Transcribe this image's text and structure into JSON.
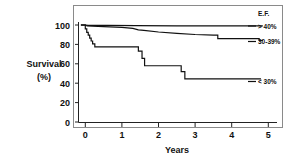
{
  "chart_data": {
    "type": "line",
    "title": "",
    "xlabel": "Years",
    "ylabel": "Survival (%)",
    "ylabel_line1": "Survival",
    "ylabel_line2": "(%)",
    "xlim": [
      -0.35,
      5.6
    ],
    "ylim": [
      0,
      108
    ],
    "grid": false,
    "legend_position": "right-inside",
    "legend_title": "E.F.",
    "x_ticks": [
      "0",
      "1",
      "2",
      "3",
      "4",
      "5"
    ],
    "x_tick_values": [
      0,
      1,
      2,
      3,
      4,
      5
    ],
    "y_ticks": [
      "0",
      "20",
      "40",
      "60",
      "80",
      "100"
    ],
    "y_tick_values": [
      0,
      20,
      40,
      60,
      80,
      100
    ],
    "curve_style": "step",
    "series": [
      {
        "name": "> 40%",
        "label": "> 40%",
        "color": "#111111",
        "points": [
          [
            -0.12,
            100.0
          ],
          [
            0.0,
            100.0
          ],
          [
            0.08,
            99.6
          ],
          [
            0.6,
            99.6
          ],
          [
            1.4,
            99.4
          ],
          [
            2.5,
            99.2
          ],
          [
            3.4,
            99.0
          ],
          [
            4.3,
            99.0
          ],
          [
            4.85,
            99.0
          ]
        ]
      },
      {
        "name": "30-39%",
        "label": "30-39%",
        "color": "#111111",
        "points": [
          [
            -0.12,
            100.0
          ],
          [
            0.0,
            100.0
          ],
          [
            0.05,
            99.0
          ],
          [
            0.5,
            98.4
          ],
          [
            1.0,
            97.6
          ],
          [
            1.3,
            96.6
          ],
          [
            1.45,
            95.0
          ],
          [
            1.6,
            94.4
          ],
          [
            2.0,
            92.8
          ],
          [
            2.5,
            91.4
          ],
          [
            3.0,
            90.2
          ],
          [
            3.5,
            89.6
          ],
          [
            3.62,
            89.6
          ],
          [
            3.62,
            86.0
          ],
          [
            4.3,
            86.0
          ],
          [
            4.75,
            86.0
          ],
          [
            4.75,
            84.0
          ],
          [
            4.85,
            84.0
          ]
        ]
      },
      {
        "name": "< 30%",
        "label": "< 30%",
        "color": "#111111",
        "points": [
          [
            -0.12,
            100.0
          ],
          [
            0.0,
            100.0
          ],
          [
            0.0,
            96.0
          ],
          [
            0.04,
            96.0
          ],
          [
            0.04,
            92.5
          ],
          [
            0.08,
            92.5
          ],
          [
            0.08,
            89.5
          ],
          [
            0.12,
            89.5
          ],
          [
            0.12,
            86.5
          ],
          [
            0.16,
            86.5
          ],
          [
            0.16,
            83.5
          ],
          [
            0.2,
            83.5
          ],
          [
            0.2,
            80.5
          ],
          [
            0.26,
            80.5
          ],
          [
            0.26,
            77.5
          ],
          [
            1.45,
            77.5
          ],
          [
            1.45,
            73.0
          ],
          [
            1.55,
            73.0
          ],
          [
            1.55,
            65.5
          ],
          [
            1.62,
            65.5
          ],
          [
            1.62,
            58.0
          ],
          [
            2.62,
            58.0
          ],
          [
            2.62,
            52.0
          ],
          [
            2.72,
            52.0
          ],
          [
            2.72,
            44.5
          ],
          [
            3.5,
            44.5
          ],
          [
            4.2,
            44.5
          ],
          [
            4.8,
            44.5
          ]
        ]
      }
    ],
    "annotations": []
  },
  "legend": {
    "title": "E.F.",
    "entries": [
      {
        "label": "> 40%"
      },
      {
        "label": "30-39%"
      },
      {
        "label": "< 30%"
      }
    ]
  },
  "axes": {
    "x_title": "Years",
    "y_title_line1": "Survival",
    "y_title_line2": "(%)"
  }
}
